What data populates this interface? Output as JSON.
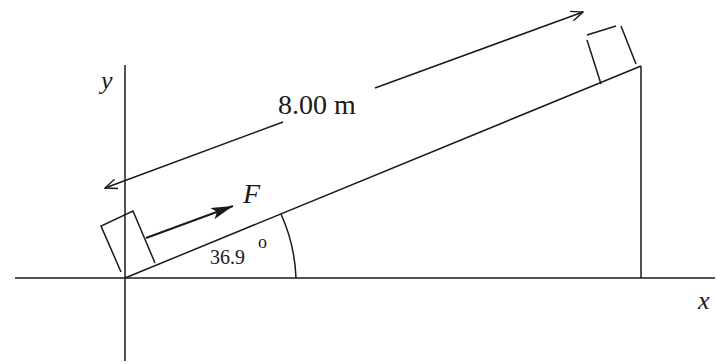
{
  "diagram": {
    "type": "inclined-plane-physics",
    "labels": {
      "y_axis": "y",
      "x_axis": "x",
      "distance": "8.00 m",
      "force": "F",
      "angle_value": "36.9",
      "angle_degree": "o"
    },
    "colors": {
      "line": "#1a1a1a",
      "background": "#ffffff"
    }
  }
}
